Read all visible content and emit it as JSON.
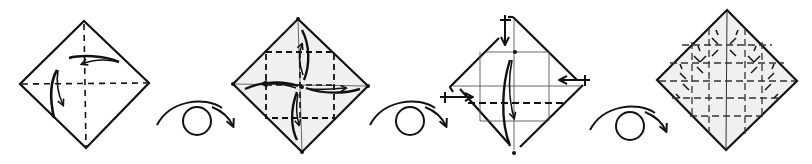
{
  "diagram": {
    "type": "origami-crease-pattern-sequence",
    "background": "#ffffff",
    "stroke_color": "#111111",
    "paper_fill": "#f0f0f0",
    "steps": [
      {
        "id": 1,
        "label": "step-1-square-with-diagonal-creases",
        "description": "Square diamond with dashed center creases; two arrows folding top and left corners",
        "corners": {
          "top": [
            84,
            21
          ],
          "right": [
            149,
            83
          ],
          "bottom": [
            86,
            148
          ],
          "left": [
            20,
            84
          ]
        }
      },
      {
        "id": 2,
        "label": "step-2-blintz-fold-arrows",
        "description": "Diamond with dashed inner square; four arrows folding corners to center",
        "corners": {
          "top": [
            298,
            19
          ],
          "right": [
            368,
            86
          ],
          "bottom": [
            302,
            152
          ],
          "left": [
            233,
            84
          ]
        }
      },
      {
        "id": 3,
        "label": "step-3-folded-corners-with-push-arrows",
        "description": "Diamond with folded corners, push/unfold arrows on top, left, right; long arrow downward",
        "corners": {
          "top": [
            513,
            17
          ],
          "right": [
            583,
            85
          ],
          "bottom": [
            514,
            153
          ],
          "left": [
            448,
            88
          ]
        }
      },
      {
        "id": 4,
        "label": "step-4-full-crease-pattern",
        "description": "Diamond showing grid of dashed creases and diagonal ticks",
        "corners": {
          "top": [
            727,
            10
          ],
          "right": [
            797,
            81
          ],
          "bottom": [
            726,
            150
          ],
          "left": [
            657,
            80
          ]
        }
      }
    ],
    "flip_symbols": [
      {
        "id": 1,
        "label": "turn-over",
        "center": [
          197,
          121
        ]
      },
      {
        "id": 2,
        "label": "turn-over",
        "center": [
          417,
          121
        ]
      },
      {
        "id": 3,
        "label": "turn-over",
        "center": [
          637,
          121
        ]
      }
    ]
  }
}
